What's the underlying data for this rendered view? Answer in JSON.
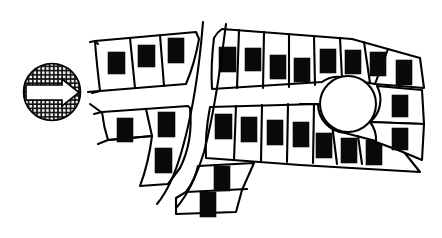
{
  "figure": {
    "kind": "cadastral-plat-map",
    "title": "Plat map of subdivision blocks with building footprints",
    "background_color": "#ffffff",
    "line_color": "#000000",
    "building_fill_color": "#0a0a0a",
    "width": 442,
    "height": 238
  },
  "direction_badge": {
    "name": "north-arrow-badge",
    "shape": "circle",
    "center_x": 52,
    "center_y": 92,
    "radius": 29,
    "fill_pattern": "crosshatch-grid",
    "pattern_color": "#111111",
    "arrow_direction": "right",
    "arrow_fill": "#ffffff",
    "label": ""
  },
  "cul_de_sac": {
    "name": "cul-de-sac-circle",
    "center_x": 348,
    "center_y": 104,
    "radius": 29,
    "fill": "#ffffff"
  },
  "blocks": [
    {
      "id": "block-upper-left",
      "label": "Upper left block",
      "parcel_count": 3,
      "building_count": 3
    },
    {
      "id": "block-upper-right",
      "label": "Upper right block",
      "parcel_count": 8,
      "building_count": 8
    },
    {
      "id": "block-middle-left",
      "label": "Middle left block",
      "parcel_count": 3,
      "building_count": 3
    },
    {
      "id": "block-lower-right",
      "label": "Lower right block",
      "parcel_count": 7,
      "building_count": 7
    },
    {
      "id": "block-lower-center",
      "label": "Lower center block",
      "parcel_count": 2,
      "building_count": 2
    },
    {
      "id": "block-far-right",
      "label": "Far right block",
      "parcel_count": 4,
      "building_count": 4
    }
  ],
  "streets": [
    {
      "id": "street-vertical",
      "label": "Curved north-south street corridor",
      "orientation": "vertical-curved"
    },
    {
      "id": "street-horizontal",
      "label": "Curved east-west street corridor",
      "orientation": "horizontal-curved"
    }
  ],
  "totals": {
    "parcels": 27,
    "buildings": 27
  }
}
